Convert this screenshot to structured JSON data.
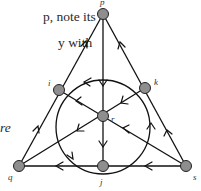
{
  "text_fragments": {
    "line1": "p, note its",
    "line2": "y with",
    "line3": "re"
  },
  "diagram": {
    "type": "directed-graph",
    "colors": {
      "edge": "#111111",
      "node_fill": "#8e8e8e",
      "node_stroke": "#222222",
      "label": "#333333"
    },
    "nodes": [
      {
        "id": "p",
        "label": "p",
        "x": 103,
        "y": 14
      },
      {
        "id": "i",
        "label": "i",
        "x": 59,
        "y": 90
      },
      {
        "id": "k",
        "label": "k",
        "x": 145,
        "y": 88
      },
      {
        "id": "r",
        "label": "r",
        "x": 103,
        "y": 116
      },
      {
        "id": "q",
        "label": "q",
        "x": 19,
        "y": 166
      },
      {
        "id": "j",
        "label": "j",
        "x": 103,
        "y": 166
      },
      {
        "id": "s",
        "label": "s",
        "x": 186,
        "y": 166
      }
    ],
    "edges": [
      {
        "from": "q",
        "to": "i"
      },
      {
        "from": "i",
        "to": "p"
      },
      {
        "from": "s",
        "to": "k"
      },
      {
        "from": "k",
        "to": "p"
      },
      {
        "from": "p",
        "to": "r"
      },
      {
        "from": "r",
        "to": "j"
      },
      {
        "from": "k",
        "to": "r"
      },
      {
        "from": "r",
        "to": "i"
      },
      {
        "from": "r",
        "to": "q"
      },
      {
        "from": "s",
        "to": "r"
      },
      {
        "from": "j",
        "to": "q"
      },
      {
        "from": "s",
        "to": "j"
      },
      {
        "from": "k",
        "to": "i",
        "curve": "circle-top"
      },
      {
        "from": "i",
        "to": "j",
        "curve": "circle-left"
      },
      {
        "from": "j",
        "to": "k",
        "curve": "circle-right"
      }
    ],
    "circle": {
      "cx": 103,
      "cy": 131,
      "r": 50
    }
  }
}
